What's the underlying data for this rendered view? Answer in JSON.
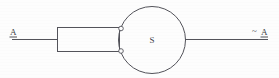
{
  "diagram": {
    "background_color": "#fdfdfd",
    "stroke_color": "#53535a",
    "labels": {
      "input": "A",
      "input_accent": "underline",
      "output_prefix": "~",
      "output": "A",
      "circle": "S"
    },
    "nodes": [
      {
        "name": "input-lead",
        "type": "wire",
        "from_x": 12,
        "to_x": 57,
        "y": 39
      },
      {
        "name": "block",
        "type": "rectangle",
        "x": 57,
        "y": 27,
        "width": 63,
        "height": 25
      },
      {
        "name": "circle",
        "type": "circle",
        "cx": 152,
        "cy": 40,
        "r": 33,
        "label": "S"
      },
      {
        "name": "upper-terminal",
        "type": "terminal",
        "cx": 121,
        "cy": 28,
        "r": 2.2
      },
      {
        "name": "lower-terminal",
        "type": "terminal",
        "cx": 121,
        "cy": 51,
        "r": 2.2
      },
      {
        "name": "output-lead",
        "type": "wire",
        "from_x": 185,
        "to_x": 268,
        "y": 39
      }
    ]
  }
}
